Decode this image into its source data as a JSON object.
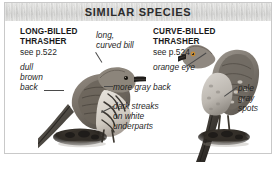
{
  "panel": {
    "header_title": "SIMILAR SPECIES",
    "frame_border_color": "#c9c9c9",
    "header_band_color": "#d9d9d7",
    "background_color": "#ffffff",
    "text_color": "#1f1f1f",
    "leader_line_color": "#4a4a4a"
  },
  "species": [
    {
      "id": "long-billed-thrasher",
      "name": "LONG-BILLED\nTHRASHER",
      "name_line1": "LONG-BILLED",
      "name_line2": "THRASHER",
      "page_reference": "see p.522",
      "position": "left"
    },
    {
      "id": "curve-billed-thrasher",
      "name": "CURVE-BILLED\nTHRASHER",
      "name_line1": "CURVE-BILLED",
      "name_line2": "THRASHER",
      "page_reference": "see p.524",
      "position": "right"
    }
  ],
  "captions": {
    "dull_brown_back": "dull\nbrown\nback",
    "long_curved_bill": "long,\ncurved bill",
    "orange_eye": "orange eye",
    "more_gray_back": "more gray back",
    "dark_streaks": "dark streaks\non white\nunderparts",
    "pale_gray_spots": "pale\ngray\nspots"
  },
  "illustrations": [
    {
      "id": "bird-illustration-long-billed-thrasher",
      "label": "Long-billed Thrasher perched on mound, facing right",
      "plumage": "dull brown back with dark streaks on white underparts",
      "orientation": "facing-right"
    },
    {
      "id": "bird-illustration-curve-billed-thrasher",
      "label": "Curve-billed Thrasher perched upright on mound, facing left",
      "plumage": "gray back with pale gray spots and orange eye",
      "orientation": "facing-left"
    }
  ]
}
